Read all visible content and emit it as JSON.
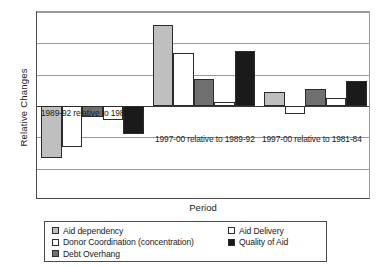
{
  "chart_data": {
    "type": "bar",
    "title": "",
    "xlabel": "Period",
    "ylabel": "Relative Changes",
    "ylim": [
      -15,
      15
    ],
    "grid": true,
    "legend_position": "bottom",
    "ytick_labels": [
      "15",
      "10",
      "5",
      "0",
      "-5",
      "-15"
    ],
    "ytick_values": [
      15,
      10,
      5,
      0,
      -5,
      -10
    ],
    "categories": [
      "1989-92 relative to 1981-84",
      "1997-00 relative to 1989-92",
      "1997-00 relative to 1981-84"
    ],
    "series": [
      {
        "name": "Aid dependency",
        "color": "#bfbfbf",
        "values": [
          -8.3,
          13.0,
          2.2
        ]
      },
      {
        "name": "Donor Coordination (concentration)",
        "color": "#ffffff",
        "values": [
          -6.5,
          8.5,
          -1.3
        ]
      },
      {
        "name": "Debt Overhang",
        "color": "#707070",
        "values": [
          -1.7,
          4.3,
          2.7
        ]
      },
      {
        "name": "Aid Delivery",
        "color": "#ffffff",
        "values": [
          -2.2,
          0.7,
          1.3
        ]
      },
      {
        "name": "Quality of Aid",
        "color": "#1a1a1a",
        "values": [
          -4.4,
          8.7,
          4.0
        ]
      }
    ],
    "legend": [
      {
        "label": "Aid dependency",
        "swatch": "#bfbfbf"
      },
      {
        "label": "Donor Coordination (concentration)",
        "swatch": "#ffffff"
      },
      {
        "label": "Debt Overhang",
        "swatch": "#707070"
      },
      {
        "label": "Aid Delivery",
        "swatch": "#ffffff"
      },
      {
        "label": "Quality of Aid",
        "swatch": "#1a1a1a"
      }
    ],
    "annotations": [
      "1989-92 relative to 1981-84",
      "1997-00 relative to 1989-92",
      "1997-00 relative to 1981-84"
    ]
  }
}
